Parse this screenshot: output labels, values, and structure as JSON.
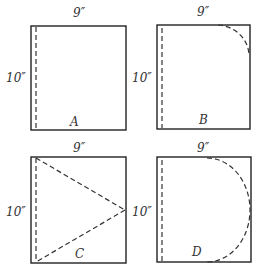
{
  "figure": {
    "panels": [
      {
        "id": "A",
        "label": "A",
        "width_label": "9″",
        "height_label": "10″",
        "cut": "straight-seam"
      },
      {
        "id": "B",
        "label": "B",
        "width_label": "9″",
        "height_label": "10″",
        "cut": "quarter-round-corner"
      },
      {
        "id": "C",
        "label": "C",
        "width_label": "9″",
        "height_label": "10″",
        "cut": "triangle"
      },
      {
        "id": "D",
        "label": "D",
        "width_label": "9″",
        "height_label": "10″",
        "cut": "semicircle"
      }
    ]
  }
}
